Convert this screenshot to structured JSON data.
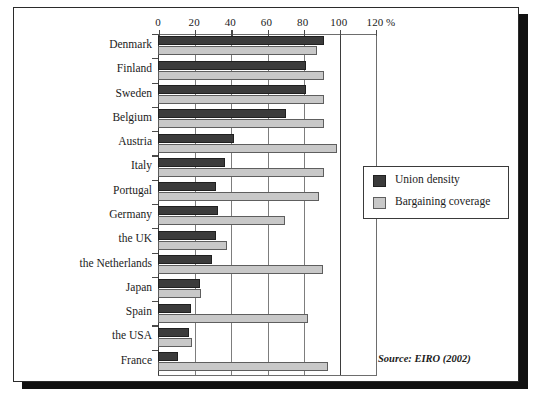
{
  "figure": {
    "source_note": "Source: EIRO (2002)",
    "caption": ""
  },
  "legend": {
    "position": "inside-right",
    "items": [
      {
        "label": "Union density",
        "color": "#3b3b3b",
        "swatch": "density"
      },
      {
        "label": "Bargaining coverage",
        "color": "#c8c8c8",
        "swatch": "coverage"
      }
    ]
  },
  "axis": {
    "unit_label": "%",
    "tick_labels": [
      "0",
      "20",
      "40",
      "60",
      "80",
      "100",
      "120"
    ]
  },
  "chart_data": {
    "type": "bar",
    "orientation": "horizontal",
    "title": "",
    "subtitle": "",
    "xlabel": "%",
    "ylabel": "",
    "xlim": [
      0,
      120
    ],
    "xticks": [
      0,
      20,
      40,
      60,
      80,
      100,
      120
    ],
    "grid": true,
    "legend_position": "inside-right",
    "annotations": [
      "Source: EIRO (2002)"
    ],
    "categories": [
      "Denmark",
      "Finland",
      "Sweden",
      "Belgium",
      "Austria",
      "Italy",
      "Portugal",
      "Germany",
      "the UK",
      "the Netherlands",
      "Japan",
      "Spain",
      "the USA",
      "France"
    ],
    "series": [
      {
        "name": "Union density",
        "color": "#3b3b3b",
        "values": [
          92,
          82,
          82,
          71,
          42,
          37,
          32,
          33,
          32,
          30,
          23,
          18,
          17,
          11
        ]
      },
      {
        "name": "Bargaining coverage",
        "color": "#c8c8c8",
        "values": [
          88,
          92,
          92,
          92,
          99,
          92,
          89,
          70,
          38,
          91,
          24,
          83,
          19,
          94
        ]
      }
    ]
  }
}
